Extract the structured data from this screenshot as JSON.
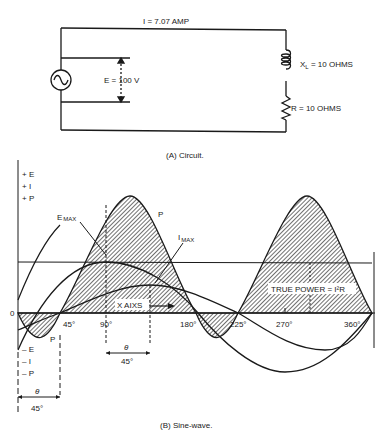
{
  "circuit": {
    "current_label": "I = 7.07 AMP",
    "voltage_label": "E = 100 V",
    "inductor_label_prefix": "X",
    "inductor_label_sub": "L",
    "inductor_label_suffix": " = 10 OHMS",
    "resistor_label": "R = 10 OHMS",
    "source_icon": "ac-source-icon",
    "caption": "(A)  Circuit."
  },
  "graph": {
    "y_labels_positive": [
      "+ E",
      "+ I",
      "+ P"
    ],
    "y_labels_negative": [
      "– E",
      "– I",
      "– P"
    ],
    "origin_label": "0",
    "x_ticks": [
      "45°",
      "90°",
      "180°",
      "225°",
      "270°",
      "360°"
    ],
    "e_max_label_main": "E",
    "e_max_label_sub": "MAX",
    "i_max_label_main": "I",
    "i_max_label_sub": "MAX",
    "p_label_top": "P",
    "p_label_bottom": "P",
    "x_axis_label": "X AIXS",
    "true_power_label": "TRUE POWER = I²R",
    "theta_symbol": "θ",
    "theta_value_center": "45°",
    "theta_value_left": "45°",
    "caption": "(B)  Sine-wave."
  },
  "colors": {
    "ink": "#1a1a1a",
    "background": "#ffffff"
  }
}
